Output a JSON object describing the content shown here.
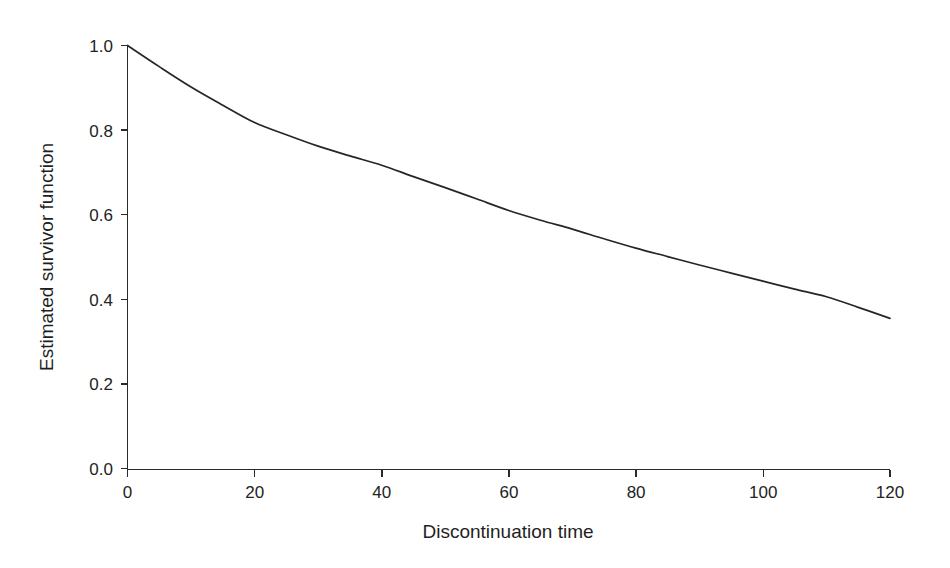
{
  "chart_data": {
    "type": "line",
    "title": "",
    "subtitle": "",
    "xlabel": "Discontinuation time",
    "ylabel": "Estimated survivor function",
    "xlim": [
      0,
      120
    ],
    "ylim": [
      0.0,
      1.0
    ],
    "xticks": [
      "0",
      "20",
      "40",
      "60",
      "80",
      "100",
      "120"
    ],
    "xtick_values": [
      0,
      20,
      40,
      60,
      80,
      100,
      120
    ],
    "yticks": [
      "0.0",
      "0.2",
      "0.4",
      "0.6",
      "0.8",
      "1.0"
    ],
    "ytick_values": [
      0.0,
      0.2,
      0.4,
      0.6,
      0.8,
      1.0
    ],
    "grid": false,
    "legend": false,
    "legend_position": "none",
    "line_color": "#262626",
    "axis_color": "#2b2b2b",
    "background_color": "#ffffff",
    "series": [
      {
        "name": "Estimated survivor function",
        "x": [
          0,
          5,
          10,
          15,
          20,
          25,
          30,
          35,
          40,
          45,
          50,
          55,
          60,
          65,
          70,
          75,
          80,
          85,
          90,
          95,
          100,
          105,
          110,
          115,
          120
        ],
        "values": [
          1.0,
          0.95,
          0.902,
          0.859,
          0.818,
          0.789,
          0.762,
          0.739,
          0.717,
          0.69,
          0.664,
          0.637,
          0.61,
          0.587,
          0.566,
          0.543,
          0.521,
          0.501,
          0.481,
          0.462,
          0.443,
          0.424,
          0.406,
          0.381,
          0.355
        ]
      }
    ]
  },
  "axes": {
    "y_title": "Estimated survivor function",
    "x_title": "Discontinuation time"
  }
}
